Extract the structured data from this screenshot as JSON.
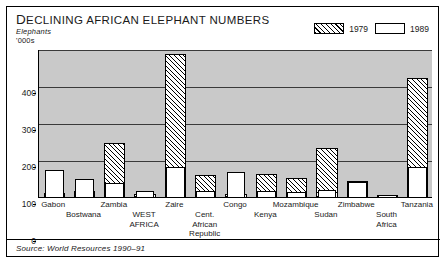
{
  "header": {
    "title_lead": "D",
    "title": "ECLINING AFRICAN ELEPHANT NUMBERS",
    "title_full": "Declining African Elephant Numbers",
    "unit_line1": "Elephants",
    "unit_line2": "'000s"
  },
  "legend": {
    "items": [
      {
        "label": "1979",
        "swatch": "hatched",
        "color": "#000000"
      },
      {
        "label": "1989",
        "swatch": "white",
        "color": "#ffffff"
      }
    ]
  },
  "footer": {
    "source": "Source: World Resources 1990–91"
  },
  "chart_data": {
    "type": "bar",
    "title": "Declining African Elephant Numbers",
    "xlabel": "",
    "ylabel": "Elephants '000s",
    "ylim": [
      0,
      400
    ],
    "yticks": [
      0,
      100,
      200,
      300,
      400
    ],
    "grid": true,
    "legend_position": "top-right",
    "note": "Overlaid bars: 1979 (hatched) drawn behind, 1989 (white) in front",
    "categories": [
      "Gabon",
      "Bostwana",
      "Zambia",
      "WEST AFRICA",
      "Zaire",
      "Cent. African Republic",
      "Congo",
      "Kenya",
      "Mozambique",
      "Sudan",
      "Zimbabwe",
      "South Africa",
      "Tanzania"
    ],
    "series": [
      {
        "name": "1979",
        "values": [
          14,
          20,
          150,
          10,
          390,
          63,
          10,
          65,
          55,
          135,
          47,
          8,
          325
        ]
      },
      {
        "name": "1989",
        "values": [
          76,
          51,
          41,
          19,
          85,
          19,
          70,
          19,
          17,
          22,
          43,
          7,
          85
        ]
      }
    ],
    "label_rows": [
      0,
      1,
      0,
      1,
      0,
      1,
      0,
      1,
      0,
      1,
      0,
      1,
      0
    ]
  }
}
